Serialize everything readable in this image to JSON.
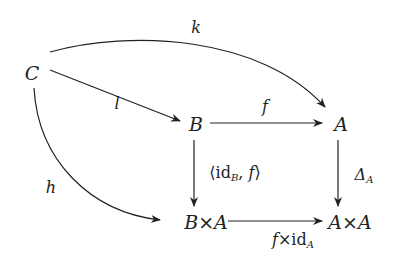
{
  "diagram": {
    "type": "commutative-diagram",
    "nodes": {
      "C": {
        "label": "C"
      },
      "B": {
        "label": "B"
      },
      "A": {
        "label": "A"
      },
      "BxA": {
        "left": "B",
        "times": "×",
        "right": "A"
      },
      "AxA": {
        "left": "A",
        "times": "×",
        "right": "A"
      }
    },
    "arrows": {
      "k": {
        "from": "C",
        "to": "A",
        "label": "k",
        "shape": "curved-up"
      },
      "l": {
        "from": "C",
        "to": "B",
        "label": "l"
      },
      "h": {
        "from": "C",
        "to": "B×A",
        "label": "h",
        "shape": "curved-down"
      },
      "f": {
        "from": "B",
        "to": "A",
        "label": "f"
      },
      "pair": {
        "from": "B",
        "to": "B×A",
        "open": "⟨",
        "id": "id",
        "sub": "B",
        "sep": ", ",
        "f": "f",
        "close": "⟩"
      },
      "delta": {
        "from": "A",
        "to": "A×A",
        "symbol": "Δ",
        "sub": "A"
      },
      "fxid": {
        "from": "B×A",
        "to": "A×A",
        "f": "f",
        "times": "×",
        "id": "id",
        "sub": "A"
      }
    },
    "colors": {
      "ink": "#222222",
      "background": "#ffffff"
    }
  }
}
